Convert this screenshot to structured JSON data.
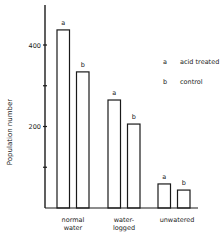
{
  "chart_data": {
    "type": "bar",
    "title": "",
    "xlabel": "",
    "ylabel": "Population number",
    "ylim": [
      0,
      500
    ],
    "yticks": [
      100,
      200,
      300,
      400
    ],
    "ytick_labels": [
      "",
      "200",
      "",
      "400"
    ],
    "categories": [
      "normal\nwater",
      "water-\nlogged",
      "unwatered"
    ],
    "category_lines": [
      [
        "normal",
        "water"
      ],
      [
        "water-",
        "logged"
      ],
      [
        "unwatered"
      ]
    ],
    "series": [
      {
        "name": "acid treated",
        "key": "a",
        "values": [
          437,
          265,
          59
        ]
      },
      {
        "name": "control",
        "key": "b",
        "values": [
          334,
          206,
          44
        ]
      }
    ],
    "legend": {
      "placement": "top-right",
      "entries": [
        {
          "key": "a",
          "label": "acid treated"
        },
        {
          "key": "b",
          "label": "control"
        }
      ]
    },
    "grid": false
  }
}
